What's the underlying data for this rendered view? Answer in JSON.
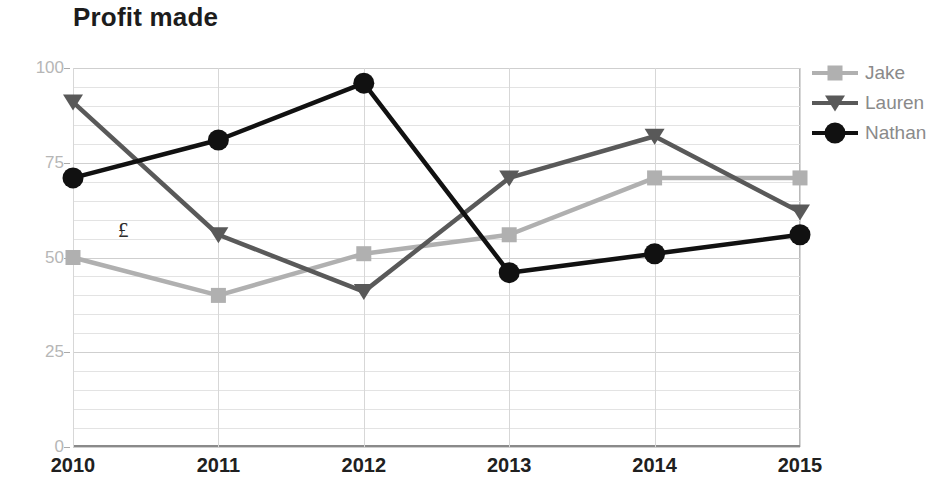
{
  "chart_data": {
    "type": "line",
    "title": "Profit made",
    "xlabel": "",
    "ylabel": "",
    "annotation": "£",
    "categories": [
      "2010",
      "2011",
      "2012",
      "2013",
      "2014",
      "2015"
    ],
    "x": [
      2010,
      2011,
      2012,
      2013,
      2014,
      2015
    ],
    "ylim": [
      0,
      100
    ],
    "yticks": [
      0,
      25,
      50,
      75,
      100
    ],
    "ytick_labels": [
      "0",
      "25",
      "50",
      "75",
      "100"
    ],
    "grid": {
      "horizontal": true,
      "horizontal_minor_step": 5,
      "vertical": true
    },
    "legend_position": "right",
    "series": [
      {
        "name": "Jake",
        "color": "#b0b0b0",
        "marker": "square",
        "values": [
          50,
          40,
          51,
          56,
          71,
          71
        ]
      },
      {
        "name": "Lauren",
        "color": "#595959",
        "marker": "triangle",
        "values": [
          91,
          56,
          41,
          71,
          82,
          62
        ]
      },
      {
        "name": "Nathan",
        "color": "#111111",
        "marker": "circle",
        "values": [
          71,
          81,
          96,
          46,
          51,
          56
        ]
      }
    ]
  },
  "axis": {
    "y_labels": [
      "100",
      "75",
      "50",
      "25",
      "0"
    ],
    "x_labels": [
      "2010",
      "2011",
      "2012",
      "2013",
      "2014",
      "2015"
    ]
  },
  "legend": {
    "items": [
      {
        "label": "Jake"
      },
      {
        "label": "Lauren"
      },
      {
        "label": "Nathan"
      }
    ]
  }
}
